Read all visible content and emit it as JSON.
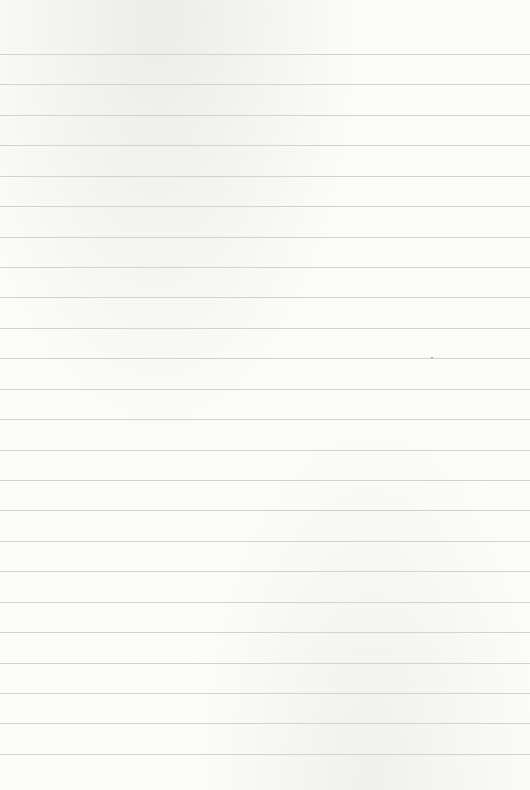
{
  "paper": {
    "type": "lined-paper",
    "background_color": "#fcfcfb",
    "line_color": "#d2d2d0",
    "line_count": 24,
    "first_line_y": 54,
    "line_spacing": 30.43
  }
}
